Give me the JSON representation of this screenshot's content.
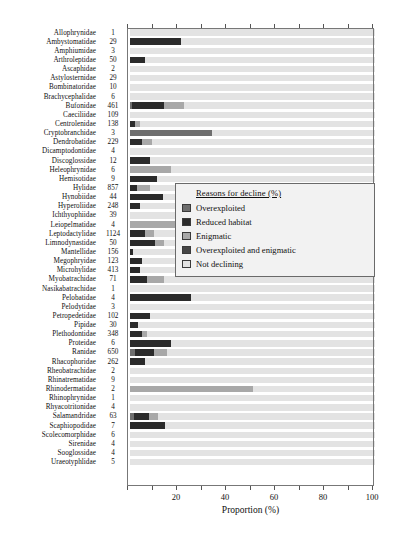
{
  "chart_data": {
    "type": "bar",
    "orientation": "horizontal",
    "stacked": true,
    "title": "",
    "xlabel": "Proportion (%)",
    "ylabel": "",
    "xlim": [
      0,
      100
    ],
    "xticks": [
      0,
      10,
      20,
      30,
      40,
      50,
      60,
      70,
      80,
      90,
      100
    ],
    "xticklabels": [
      "",
      "",
      "20",
      "",
      "40",
      "",
      "60",
      "",
      "80",
      "",
      "100"
    ],
    "grid": false,
    "legend": {
      "position": "center-right",
      "title": "Reasons for decline (%)",
      "entries": [
        {
          "label": "Overexploited",
          "color": "#6e6e6e"
        },
        {
          "label": "Reduced habitat",
          "color": "#2b2b2b"
        },
        {
          "label": "Enigmatic",
          "color": "#a8a8a8"
        },
        {
          "label": "Overexploited and enigmatic",
          "color": "#454545"
        },
        {
          "label": "Not declining",
          "color": "#e3e3e3"
        }
      ]
    },
    "series": [
      {
        "name": "Overexploited",
        "color": "#6e6e6e"
      },
      {
        "name": "Reduced habitat",
        "color": "#2b2b2b"
      },
      {
        "name": "Enigmatic",
        "color": "#a8a8a8"
      },
      {
        "name": "Overexploited and enigmatic",
        "color": "#454545"
      },
      {
        "name": "Not declining",
        "color": "#e3e3e3"
      }
    ],
    "categories": [
      "Allophrynidae",
      "Ambystomatidae",
      "Amphiumidae",
      "Arthroleptidae",
      "Ascaphidae",
      "Astylosternidae",
      "Bombinatoridae",
      "Brachycephalidae",
      "Bufonidae",
      "Caeciliidae",
      "Centrolenidae",
      "Cryptobranchidae",
      "Dendrobatidae",
      "Dicamptodontidae",
      "Discoglossidae",
      "Heleophrynidae",
      "Hemisotidae",
      "Hylidae",
      "Hynobiidae",
      "Hyperoliidae",
      "Ichthyophiidae",
      "Leiopelmatidae",
      "Leptodactylidae",
      "Limnodynastidae",
      "Mantellidae",
      "Megophryidae",
      "Microhylidae",
      "Myobatrachidae",
      "Nasikabatrachidae",
      "Pelobatidae",
      "Pelodytidae",
      "Petropedetidae",
      "Pipidae",
      "Plethodontidae",
      "Proteidae",
      "Ranidae",
      "Rhacophoridae",
      "Rheobatrachidae",
      "Rhinatrematidae",
      "Rhinodermatidae",
      "Rhinophrynidae",
      "Rhyacotritonidae",
      "Salamandridae",
      "Scaphiopodidae",
      "Scolecomorphidae",
      "Sirenidae",
      "Sooglossidae",
      "Uraeotyphlidae"
    ],
    "counts": [
      1,
      29,
      3,
      50,
      2,
      29,
      10,
      6,
      461,
      109,
      138,
      3,
      229,
      4,
      12,
      6,
      9,
      857,
      44,
      248,
      39,
      4,
      1124,
      50,
      156,
      123,
      413,
      71,
      1,
      4,
      3,
      102,
      30,
      348,
      6,
      650,
      262,
      2,
      9,
      2,
      1,
      4,
      63,
      7,
      6,
      4,
      4,
      5
    ],
    "rows": [
      {
        "family": "Allophrynidae",
        "n": 1,
        "overexploited": 0,
        "reduced_habitat": 0,
        "enigmatic": 0,
        "over_and_enig": 0,
        "not_declining": 100
      },
      {
        "family": "Ambystomatidae",
        "n": 29,
        "overexploited": 0,
        "reduced_habitat": 20.7,
        "enigmatic": 0,
        "over_and_enig": 0,
        "not_declining": 79.3
      },
      {
        "family": "Amphiumidae",
        "n": 3,
        "overexploited": 0,
        "reduced_habitat": 0,
        "enigmatic": 0,
        "over_and_enig": 0,
        "not_declining": 100
      },
      {
        "family": "Arthroleptidae",
        "n": 50,
        "overexploited": 0,
        "reduced_habitat": 6.0,
        "enigmatic": 0,
        "over_and_enig": 0,
        "not_declining": 94.0
      },
      {
        "family": "Ascaphidae",
        "n": 2,
        "overexploited": 0,
        "reduced_habitat": 0,
        "enigmatic": 0,
        "over_and_enig": 0,
        "not_declining": 100
      },
      {
        "family": "Astylosternidae",
        "n": 29,
        "overexploited": 0,
        "reduced_habitat": 0,
        "enigmatic": 0,
        "over_and_enig": 0,
        "not_declining": 100
      },
      {
        "family": "Bombinatoridae",
        "n": 10,
        "overexploited": 0,
        "reduced_habitat": 0,
        "enigmatic": 0,
        "over_and_enig": 0,
        "not_declining": 100
      },
      {
        "family": "Brachycephalidae",
        "n": 6,
        "overexploited": 0,
        "reduced_habitat": 0,
        "enigmatic": 0,
        "over_and_enig": 0,
        "not_declining": 100
      },
      {
        "family": "Bufonidae",
        "n": 461,
        "overexploited": 1.0,
        "reduced_habitat": 13.0,
        "enigmatic": 8.0,
        "over_and_enig": 0,
        "not_declining": 78.0
      },
      {
        "family": "Caeciliidae",
        "n": 109,
        "overexploited": 0,
        "reduced_habitat": 0,
        "enigmatic": 0,
        "over_and_enig": 0,
        "not_declining": 100
      },
      {
        "family": "Centrolenidae",
        "n": 138,
        "overexploited": 0,
        "reduced_habitat": 2.0,
        "enigmatic": 2.0,
        "over_and_enig": 0,
        "not_declining": 96.0
      },
      {
        "family": "Cryptobranchidae",
        "n": 3,
        "overexploited": 33.3,
        "reduced_habitat": 0,
        "enigmatic": 0,
        "over_and_enig": 0,
        "not_declining": 66.7
      },
      {
        "family": "Dendrobatidae",
        "n": 229,
        "overexploited": 0,
        "reduced_habitat": 5.0,
        "enigmatic": 4.0,
        "over_and_enig": 0,
        "not_declining": 91.0
      },
      {
        "family": "Dicamptodontidae",
        "n": 4,
        "overexploited": 0,
        "reduced_habitat": 0,
        "enigmatic": 0,
        "over_and_enig": 0,
        "not_declining": 100
      },
      {
        "family": "Discoglossidae",
        "n": 12,
        "overexploited": 0,
        "reduced_habitat": 8.3,
        "enigmatic": 0,
        "over_and_enig": 0,
        "not_declining": 91.7
      },
      {
        "family": "Heleophrynidae",
        "n": 6,
        "overexploited": 0,
        "reduced_habitat": 0,
        "enigmatic": 16.7,
        "over_and_enig": 0,
        "not_declining": 83.3
      },
      {
        "family": "Hemisotidae",
        "n": 9,
        "overexploited": 0,
        "reduced_habitat": 11.1,
        "enigmatic": 0,
        "over_and_enig": 0,
        "not_declining": 88.9
      },
      {
        "family": "Hylidae",
        "n": 857,
        "overexploited": 0,
        "reduced_habitat": 3.0,
        "enigmatic": 5.0,
        "over_and_enig": 0,
        "not_declining": 92.0
      },
      {
        "family": "Hynobiidae",
        "n": 44,
        "overexploited": 0,
        "reduced_habitat": 13.6,
        "enigmatic": 0,
        "over_and_enig": 0,
        "not_declining": 86.4
      },
      {
        "family": "Hyperoliidae",
        "n": 248,
        "overexploited": 0,
        "reduced_habitat": 4.0,
        "enigmatic": 0,
        "over_and_enig": 0,
        "not_declining": 96.0
      },
      {
        "family": "Ichthyophiidae",
        "n": 39,
        "overexploited": 0,
        "reduced_habitat": 0,
        "enigmatic": 0,
        "over_and_enig": 0,
        "not_declining": 100
      },
      {
        "family": "Leiopelmatidae",
        "n": 4,
        "overexploited": 0,
        "reduced_habitat": 0,
        "enigmatic": 25.0,
        "over_and_enig": 0,
        "not_declining": 75.0
      },
      {
        "family": "Leptodactylidae",
        "n": 1124,
        "overexploited": 0,
        "reduced_habitat": 6.0,
        "enigmatic": 4.0,
        "over_and_enig": 0,
        "not_declining": 90.0
      },
      {
        "family": "Limnodynastidae",
        "n": 50,
        "overexploited": 0,
        "reduced_habitat": 10.0,
        "enigmatic": 4.0,
        "over_and_enig": 0,
        "not_declining": 86.0
      },
      {
        "family": "Mantellidae",
        "n": 156,
        "overexploited": 0,
        "reduced_habitat": 1.3,
        "enigmatic": 0,
        "over_and_enig": 0,
        "not_declining": 98.7
      },
      {
        "family": "Megophryidae",
        "n": 123,
        "overexploited": 0,
        "reduced_habitat": 5.0,
        "enigmatic": 0,
        "over_and_enig": 0,
        "not_declining": 95.0
      },
      {
        "family": "Microhylidae",
        "n": 413,
        "overexploited": 0,
        "reduced_habitat": 4.0,
        "enigmatic": 0,
        "over_and_enig": 0,
        "not_declining": 96.0
      },
      {
        "family": "Myobatrachidae",
        "n": 71,
        "overexploited": 0,
        "reduced_habitat": 7.0,
        "enigmatic": 7.0,
        "over_and_enig": 0,
        "not_declining": 86.0
      },
      {
        "family": "Nasikabatrachidae",
        "n": 1,
        "overexploited": 0,
        "reduced_habitat": 0,
        "enigmatic": 0,
        "over_and_enig": 0,
        "not_declining": 100
      },
      {
        "family": "Pelobatidae",
        "n": 4,
        "overexploited": 0,
        "reduced_habitat": 25.0,
        "enigmatic": 0,
        "over_and_enig": 0,
        "not_declining": 75.0
      },
      {
        "family": "Pelodytidae",
        "n": 3,
        "overexploited": 0,
        "reduced_habitat": 0,
        "enigmatic": 0,
        "over_and_enig": 0,
        "not_declining": 100
      },
      {
        "family": "Petropedetidae",
        "n": 102,
        "overexploited": 0,
        "reduced_habitat": 8.0,
        "enigmatic": 0,
        "over_and_enig": 0,
        "not_declining": 92.0
      },
      {
        "family": "Pipidae",
        "n": 30,
        "overexploited": 0,
        "reduced_habitat": 3.3,
        "enigmatic": 0,
        "over_and_enig": 0,
        "not_declining": 96.7
      },
      {
        "family": "Plethodontidae",
        "n": 348,
        "overexploited": 0,
        "reduced_habitat": 5.0,
        "enigmatic": 2.0,
        "over_and_enig": 0,
        "not_declining": 93.0
      },
      {
        "family": "Proteidae",
        "n": 6,
        "overexploited": 0,
        "reduced_habitat": 16.7,
        "enigmatic": 0,
        "over_and_enig": 0,
        "not_declining": 83.3
      },
      {
        "family": "Ranidae",
        "n": 650,
        "overexploited": 2.0,
        "reduced_habitat": 8.0,
        "enigmatic": 5.0,
        "over_and_enig": 0,
        "not_declining": 85.0
      },
      {
        "family": "Rhacophoridae",
        "n": 262,
        "overexploited": 0,
        "reduced_habitat": 6.0,
        "enigmatic": 0,
        "over_and_enig": 0,
        "not_declining": 94.0
      },
      {
        "family": "Rheobatrachidae",
        "n": 2,
        "overexploited": 0,
        "reduced_habitat": 0,
        "enigmatic": 0,
        "over_and_enig": 0,
        "not_declining": 100
      },
      {
        "family": "Rhinatrematidae",
        "n": 9,
        "overexploited": 0,
        "reduced_habitat": 0,
        "enigmatic": 0,
        "over_and_enig": 0,
        "not_declining": 100
      },
      {
        "family": "Rhinodermatidae",
        "n": 2,
        "overexploited": 0,
        "reduced_habitat": 0,
        "enigmatic": 50.0,
        "over_and_enig": 0,
        "not_declining": 50.0
      },
      {
        "family": "Rhinophrynidae",
        "n": 1,
        "overexploited": 0,
        "reduced_habitat": 0,
        "enigmatic": 0,
        "over_and_enig": 0,
        "not_declining": 100
      },
      {
        "family": "Rhyacotritonidae",
        "n": 4,
        "overexploited": 0,
        "reduced_habitat": 0,
        "enigmatic": 0,
        "over_and_enig": 0,
        "not_declining": 100
      },
      {
        "family": "Salamandridae",
        "n": 63,
        "overexploited": 1.6,
        "reduced_habitat": 6.0,
        "enigmatic": 4.0,
        "over_and_enig": 0,
        "not_declining": 88.4
      },
      {
        "family": "Scaphiopodidae",
        "n": 7,
        "overexploited": 0,
        "reduced_habitat": 14.3,
        "enigmatic": 0,
        "over_and_enig": 0,
        "not_declining": 85.7
      },
      {
        "family": "Scolecomorphidae",
        "n": 6,
        "overexploited": 0,
        "reduced_habitat": 0,
        "enigmatic": 0,
        "over_and_enig": 0,
        "not_declining": 100
      },
      {
        "family": "Sirenidae",
        "n": 4,
        "overexploited": 0,
        "reduced_habitat": 0,
        "enigmatic": 0,
        "over_and_enig": 0,
        "not_declining": 100
      },
      {
        "family": "Sooglossidae",
        "n": 4,
        "overexploited": 0,
        "reduced_habitat": 0,
        "enigmatic": 0,
        "over_and_enig": 0,
        "not_declining": 100
      },
      {
        "family": "Uraeotyphlidae",
        "n": 5,
        "overexploited": 0,
        "reduced_habitat": 0,
        "enigmatic": 0,
        "over_and_enig": 0,
        "not_declining": 100
      }
    ]
  }
}
